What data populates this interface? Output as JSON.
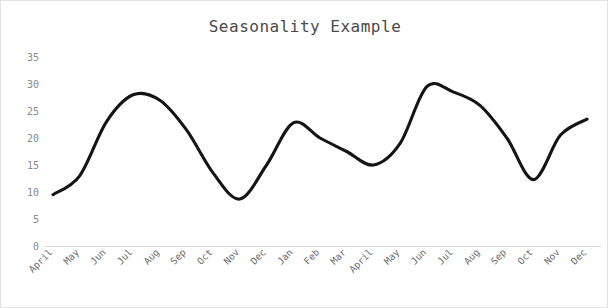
{
  "chart_data": {
    "type": "line",
    "title": "Seasonality Example",
    "xlabel": "",
    "ylabel": "",
    "ylim": [
      0,
      35
    ],
    "yticks": [
      0,
      5,
      10,
      15,
      20,
      25,
      30,
      35
    ],
    "grid": false,
    "legend": "none",
    "line_color": "#141414",
    "categories": [
      "April",
      "May",
      "Jun",
      "Jul",
      "Aug",
      "Sep",
      "Oct",
      "Nov",
      "Dec",
      "Jan",
      "Feb",
      "Mar",
      "April",
      "May",
      "Jun",
      "Jul",
      "Aug",
      "Sep",
      "Oct",
      "Nov",
      "Dec"
    ],
    "values": [
      9.5,
      13.0,
      23.0,
      28.0,
      27.0,
      21.5,
      13.5,
      8.7,
      15.0,
      22.8,
      20.0,
      17.5,
      15.0,
      19.0,
      29.5,
      28.5,
      26.0,
      20.0,
      12.3,
      20.5,
      23.5
    ],
    "series": [
      {
        "name": "Seasonality",
        "values": [
          9.5,
          13.0,
          23.0,
          28.0,
          27.0,
          21.5,
          13.5,
          8.7,
          15.0,
          22.8,
          20.0,
          17.5,
          15.0,
          19.0,
          29.5,
          28.5,
          26.0,
          20.0,
          12.3,
          20.5,
          23.5
        ]
      }
    ]
  },
  "axis": {
    "y_tick_labels": [
      "35",
      "30",
      "25",
      "20",
      "15",
      "10",
      "5",
      "0"
    ],
    "x_tick_labels": [
      "April",
      "May",
      "Jun",
      "Jul",
      "Aug",
      "Sep",
      "Oct",
      "Nov",
      "Dec",
      "Jan",
      "Feb",
      "Mar",
      "April",
      "May",
      "Jun",
      "Jul",
      "Aug",
      "Sep",
      "Oct",
      "Nov",
      "Dec"
    ]
  }
}
